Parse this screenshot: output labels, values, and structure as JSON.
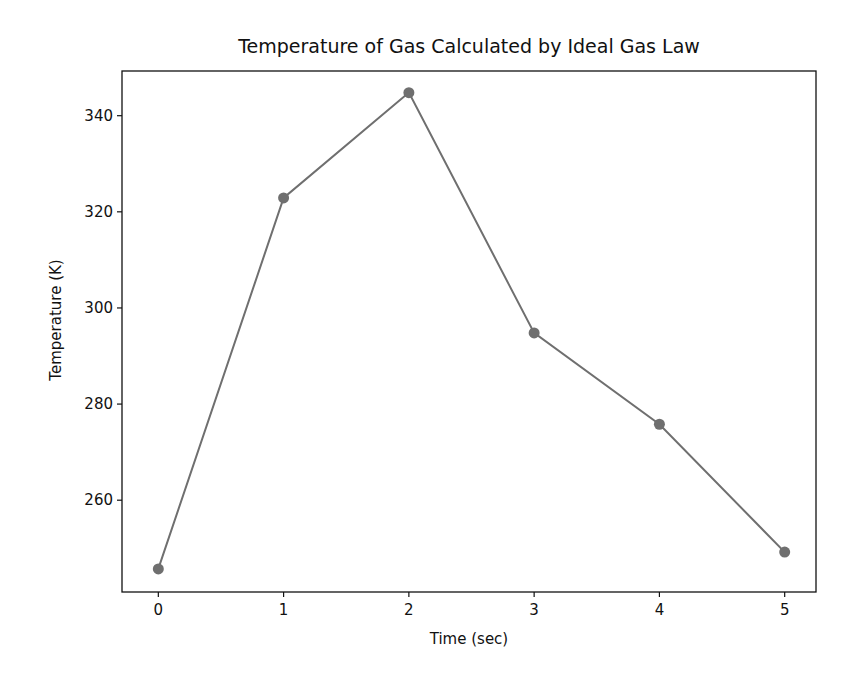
{
  "chart_data": {
    "type": "line",
    "title": "Temperature of Gas Calculated by Ideal Gas Law",
    "xlabel": "Time (sec)",
    "ylabel": "Temperature (K)",
    "x": [
      0,
      1,
      2,
      3,
      4,
      5
    ],
    "series": [
      {
        "name": "Temperature",
        "values": [
          245.7,
          322.9,
          344.8,
          294.8,
          275.8,
          249.2
        ],
        "color": "#6f6f6f",
        "marker": "circle"
      }
    ],
    "xticks": [
      0,
      1,
      2,
      3,
      4,
      5
    ],
    "yticks": [
      260,
      280,
      300,
      320,
      340
    ],
    "xlim": [
      -0.29,
      5.25
    ],
    "ylim": [
      240.9,
      349.3
    ],
    "grid": false,
    "legend": null
  },
  "layout": {
    "plot_left": 122,
    "plot_right": 816,
    "plot_top": 71,
    "plot_bottom": 592,
    "axis_color": "#111111"
  }
}
